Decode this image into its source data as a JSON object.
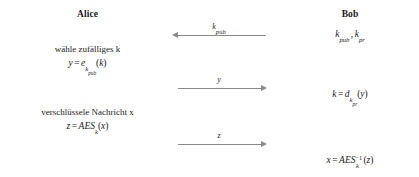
{
  "diagram": {
    "type": "hybrid-encryption-protocol-sequence",
    "language": "de",
    "parties": {
      "left": {
        "name": "Alice"
      },
      "right": {
        "name": "Bob"
      }
    },
    "left_steps": [
      {
        "id": "choose-random-k",
        "text": "wähle zufälliges k",
        "formula": "y = e_{k_pub}(k)",
        "formula_parts": {
          "lhs": "y",
          "eq": "=",
          "fn": "e",
          "sub_base": "k",
          "sub_sub": "pub",
          "arg_open": "(",
          "arg": "k",
          "arg_close": ")"
        }
      },
      {
        "id": "encrypt-message",
        "text": "verschlüssele Nachricht x",
        "formula": "z = AES_k(x)",
        "formula_parts": {
          "lhs": "z",
          "eq": "=",
          "fn": "AES",
          "sub_base": "k",
          "arg_open": "(",
          "arg": "x",
          "arg_close": ")"
        }
      }
    ],
    "right_steps": [
      {
        "id": "bob-keypair",
        "formula": "k_pub, k_pr",
        "formula_parts": {
          "k1": "k",
          "k1_sub": "pub",
          "comma": ",",
          "k2": "k",
          "k2_sub": "pr"
        }
      },
      {
        "id": "decrypt-session-key",
        "formula": "k = d_{k_pr}(y)",
        "formula_parts": {
          "lhs": "k",
          "eq": "=",
          "fn": "d",
          "sub_base": "k",
          "sub_sub": "pr",
          "arg_open": "(",
          "arg": "y",
          "arg_close": ")"
        }
      },
      {
        "id": "decrypt-message",
        "formula": "x = AES_k^{-1}(z)",
        "formula_parts": {
          "lhs": "x",
          "eq": "=",
          "fn": "AES",
          "sup": "−1",
          "sub_base": "k",
          "arg_open": "(",
          "arg": "z",
          "arg_close": ")"
        }
      }
    ],
    "messages": [
      {
        "id": "msg-kpub",
        "label": "k_pub",
        "label_parts": {
          "base": "k",
          "sub": "pub"
        },
        "direction": "left"
      },
      {
        "id": "msg-y",
        "label": "y",
        "label_parts": {
          "base": "y",
          "sub": ""
        },
        "direction": "right"
      },
      {
        "id": "msg-z",
        "label": "z",
        "label_parts": {
          "base": "z",
          "sub": ""
        },
        "direction": "right"
      }
    ],
    "colors": {
      "background": "#ffffff",
      "text": "#1a1a1a",
      "arrow": "#8a8a8a"
    }
  }
}
